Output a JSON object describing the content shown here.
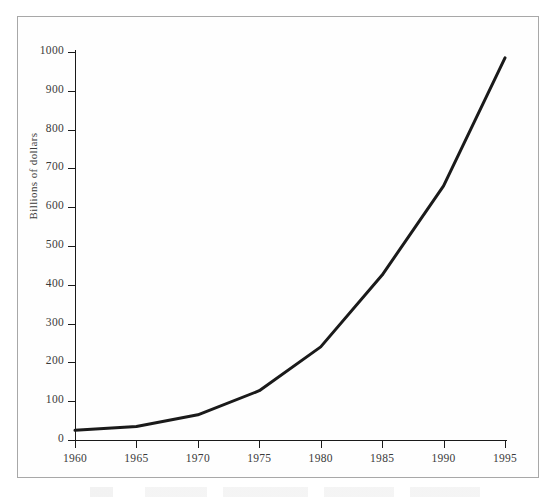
{
  "chart_data": {
    "type": "line",
    "title": "",
    "xlabel": "",
    "ylabel": "Billions of dollars",
    "x": [
      1960,
      1965,
      1970,
      1975,
      1980,
      1985,
      1990,
      1995
    ],
    "values": [
      25,
      35,
      65,
      127,
      240,
      425,
      655,
      985
    ],
    "series": [
      {
        "name": "Billions of dollars",
        "values": [
          25,
          35,
          65,
          127,
          240,
          425,
          655,
          985
        ]
      }
    ],
    "xlim": [
      1960,
      1995
    ],
    "ylim": [
      0,
      1000
    ],
    "xticks": [
      1960,
      1965,
      1970,
      1975,
      1980,
      1985,
      1990,
      1995
    ],
    "yticks": [
      0,
      100,
      200,
      300,
      400,
      500,
      600,
      700,
      800,
      900,
      1000
    ],
    "xtick_labels": [
      "1960",
      "1965",
      "1970",
      "1975",
      "1980",
      "1985",
      "1990",
      "1995"
    ],
    "ytick_labels": [
      "0",
      "100",
      "200",
      "300",
      "400",
      "500",
      "600",
      "700",
      "800",
      "900",
      "1000"
    ],
    "grid": false,
    "legend": false,
    "legend_position": "none",
    "line_color": "#1a1a1a",
    "line_width": 3,
    "axis_color": "#1a1a1a",
    "frame_color": "#a8a8a8",
    "background_color": "#ffffff"
  }
}
